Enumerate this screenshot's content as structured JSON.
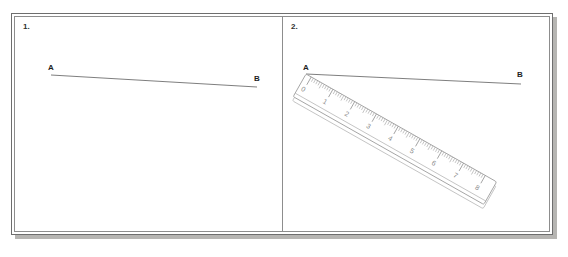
{
  "header": {
    "instruction": "the ruler"
  },
  "worksheet": {
    "panels": [
      {
        "number": "1.",
        "name": "panel-line-only",
        "point_a": "A",
        "point_b": "B",
        "has_ruler": false
      },
      {
        "number": "2.",
        "name": "panel-line-with-ruler",
        "point_a": "A",
        "point_b": "B",
        "has_ruler": true
      }
    ]
  },
  "ruler": {
    "name": "measuring-ruler",
    "unit_labels": [
      "0",
      "1",
      "2",
      "3",
      "4",
      "5",
      "6",
      "7",
      "8"
    ],
    "min": 0,
    "max": 8,
    "minor_divisions_per_unit": 10
  },
  "colors": {
    "page_background": "#ffffff",
    "frame_border": "#6e6e6e",
    "inner_border": "#8d8d8d",
    "shadow": "#b6b5b2",
    "line_stroke": "#6f6f6f",
    "ruler_stroke": "#9a9a9a",
    "label_text": "#1e1e1e"
  }
}
